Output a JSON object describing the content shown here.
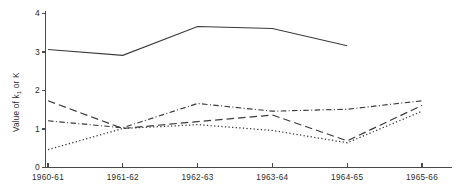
{
  "chart_data": {
    "type": "line",
    "title": "",
    "xlabel": "",
    "ylabel": "Value of k₁ or K",
    "ylabel_main": "Value of k",
    "ylabel_subscript": "1",
    "ylabel_tail": " or K",
    "categories": [
      "1960-61",
      "1961-62",
      "1962-63",
      "1963-64",
      "1964-65",
      "1965-66"
    ],
    "x": [
      0,
      1,
      2,
      3,
      4,
      5
    ],
    "ylim": [
      0,
      4
    ],
    "xlim": [
      0,
      5
    ],
    "yticks": [
      0,
      1,
      2,
      3,
      4
    ],
    "ytick_labels": [
      "0",
      "1",
      "2",
      "3",
      "4"
    ],
    "grid": false,
    "legend": "none",
    "series": [
      {
        "name": "series-solid",
        "style": "solid",
        "color": "#3a3a3a",
        "x": [
          0,
          1,
          2,
          3,
          4
        ],
        "values": [
          3.05,
          2.9,
          3.65,
          3.6,
          3.15
        ]
      },
      {
        "name": "series-dashed",
        "style": "dashed",
        "color": "#3a3a3a",
        "x": [
          0,
          1,
          2,
          3,
          4,
          5
        ],
        "values": [
          1.72,
          1.0,
          1.18,
          1.35,
          0.68,
          1.6
        ]
      },
      {
        "name": "series-dash-dot",
        "style": "dash-dot",
        "color": "#3a3a3a",
        "x": [
          0,
          1,
          2,
          3,
          4,
          5
        ],
        "values": [
          1.2,
          1.02,
          1.65,
          1.45,
          1.5,
          1.72
        ]
      },
      {
        "name": "series-dotted",
        "style": "dotted",
        "color": "#3a3a3a",
        "x": [
          0,
          1,
          2,
          3,
          4,
          5
        ],
        "values": [
          0.45,
          1.0,
          1.1,
          0.95,
          0.63,
          1.45
        ]
      }
    ]
  }
}
